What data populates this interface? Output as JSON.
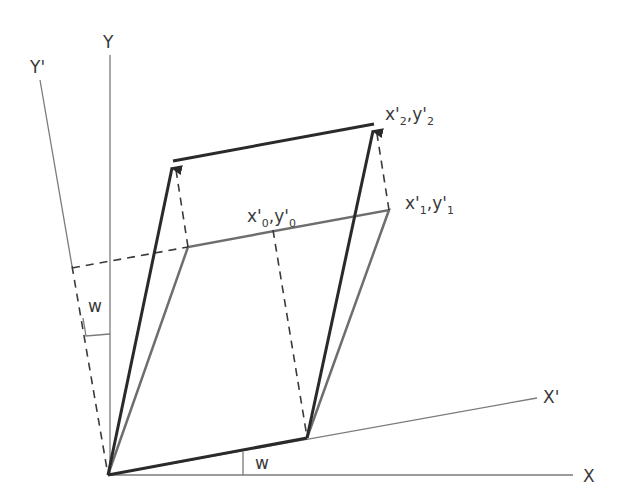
{
  "diagram": {
    "title": "",
    "axes": {
      "x": {
        "label": "X"
      },
      "y": {
        "label": "Y"
      },
      "x_prime": {
        "label": "X'"
      },
      "y_prime": {
        "label": "Y'"
      }
    },
    "angle_labels": {
      "bottom": "w",
      "left": "w"
    },
    "points": {
      "p0": {
        "x": "x'",
        "x_sub": "0",
        "sep": ",",
        "y": "y'",
        "y_sub": "0"
      },
      "p1": {
        "x": "x'",
        "x_sub": "1",
        "sep": ",",
        "y": "y'",
        "y_sub": "1"
      },
      "p2": {
        "x": "x'",
        "x_sub": "2",
        "sep": ",",
        "y": "y'",
        "y_sub": "2"
      }
    },
    "colors": {
      "axis": "#7a7a7a",
      "dark_shape": "#2a2a2a",
      "gray_shape": "#6e6e6e",
      "dashed": "#3a3a3a",
      "text": "#3a3a3a"
    }
  }
}
